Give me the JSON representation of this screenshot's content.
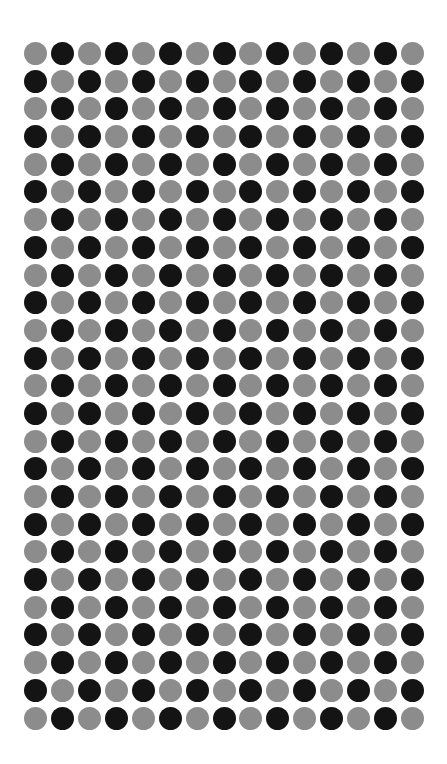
{
  "grid": {
    "rows": 25,
    "cols": 15,
    "origin_center": {
      "x": 35.5,
      "y": 53.5
    },
    "step": {
      "x": 26.93,
      "y": 27.69
    },
    "dot_diameter": 23,
    "colors": {
      "gray": "#8c8c8c",
      "black": "#141414"
    },
    "pattern": "checkerboard",
    "top_left_color": "gray",
    "cells": [
      "GBGBGBGBGBGBGBG",
      "BGBGBGBGBGBGBGB",
      "GBGBGBGBGBGBGBG",
      "BGBGBGBGBGBGBGB",
      "GBGBGBGBGBGBGBG",
      "BGBGBGBGBGBGBGB",
      "GBGBGBGBGBGBGBG",
      "BGBGBGBGBGBGBGB",
      "GBGBGBGBGBGBGBG",
      "BGBGBGBGBGBGBGB",
      "GBGBGBGBGBGBGBG",
      "BGBGBGBGBGBGBGB",
      "GBGBGBGBGBGBGBG",
      "BGBGBGBGBGBGBGB",
      "GBGBGBGBGBGBGBG",
      "BGBGBGBGBGBGBGB",
      "GBGBGBGBGBGBGBG",
      "BGBGBGBGBGBGBGB",
      "GBGBGBGBGBGBGBG",
      "BGBGBGBGBGBGBGB",
      "GBGBGBGBGBGBGBG",
      "BGBGBGBGBGBGBGB",
      "GBGBGBGBGBGBGBG",
      "BGBGBGBGBGBGBGB",
      "GBGBGBGBGBGBGBG"
    ]
  }
}
